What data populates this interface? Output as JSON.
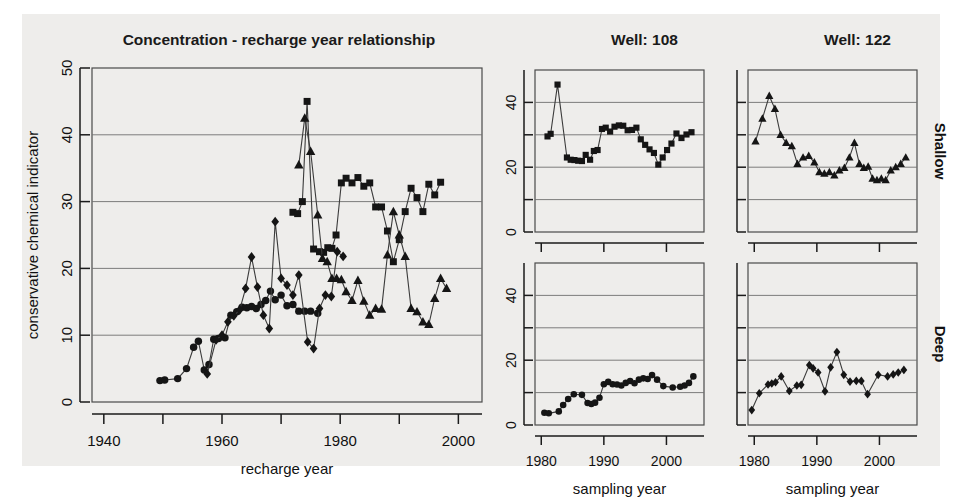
{
  "figure": {
    "background_color": "#eeedeb",
    "marker_color": "#151515",
    "page_color": "#ffffff"
  },
  "main_panel": {
    "title": "Concentration - recharge year relationship",
    "xlabel": "recharge year",
    "ylabel": "conservative chemical indicator",
    "x_ticks": [
      "1940",
      "1960",
      "1980",
      "2000"
    ],
    "y_ticks": [
      "0",
      "10",
      "20",
      "30",
      "40",
      "50"
    ]
  },
  "small_panels": {
    "column_titles": [
      "Well: 108",
      "Well: 122"
    ],
    "row_labels": [
      "Shallow",
      "Deep"
    ],
    "xlabels": [
      "sampling year",
      "sampling year"
    ],
    "x_ticks": [
      "1980",
      "1990",
      "2000"
    ],
    "y_ticks": [
      "0",
      "20",
      "40"
    ]
  },
  "chart_data": [
    {
      "id": "main",
      "type": "scatter",
      "title": "Concentration - recharge year relationship",
      "xlabel": "recharge year",
      "ylabel": "conservative chemical indicator",
      "xlim": [
        1938,
        2004
      ],
      "ylim": [
        0,
        50
      ],
      "xticks": [
        1940,
        1960,
        1980,
        2000
      ],
      "xminorticks": [
        1950,
        1970,
        1990
      ],
      "yticks": [
        0,
        10,
        20,
        30,
        40,
        50
      ],
      "grid": true,
      "legend": "none",
      "series": [
        {
          "name": "Well 108 Deep (circles)",
          "marker": "circle",
          "x": [
            1949.5,
            1950.3,
            1952.5,
            1954.0,
            1955.2,
            1956.0,
            1957.0,
            1957.8,
            1958.6,
            1959.4,
            1960.5,
            1961.5,
            1962.5,
            1963.4,
            1964.2,
            1965.0,
            1965.8,
            1966.6,
            1967.4,
            1968.2,
            1969.0,
            1970.0,
            1971.0,
            1972.0,
            1973.0,
            1974.0,
            1975.0,
            1976.2
          ],
          "y": [
            3.2,
            3.3,
            3.5,
            5.0,
            8.2,
            9.1,
            4.8,
            5.6,
            9.4,
            9.5,
            9.6,
            13.0,
            13.5,
            14.2,
            14.1,
            14.3,
            14.0,
            14.6,
            15.2,
            16.6,
            15.3,
            16.0,
            14.4,
            14.6,
            13.6,
            13.6,
            13.6,
            13.3
          ]
        },
        {
          "name": "Well 122 Deep (diamonds)",
          "marker": "diamond",
          "x": [
            1957.5,
            1959.0,
            1960.0,
            1961.0,
            1962.0,
            1963.0,
            1964.0,
            1965.0,
            1966.0,
            1967.0,
            1968.0,
            1969.0,
            1970.0,
            1971.0,
            1972.0,
            1973.0,
            1974.5,
            1975.5,
            1976.5,
            1977.5,
            1978.5,
            1979.5,
            1980.5
          ],
          "y": [
            4.2,
            9.3,
            10.0,
            12.0,
            12.9,
            13.8,
            17.0,
            21.7,
            17.2,
            13.0,
            11.0,
            27.0,
            18.5,
            17.5,
            16.0,
            19.0,
            9.0,
            8.0,
            14.0,
            16.0,
            15.8,
            22.5,
            21.8
          ]
        },
        {
          "name": "Well 108 Shallow (squares)",
          "marker": "square",
          "x": [
            1972.0,
            1972.8,
            1973.6,
            1974.4,
            1975.5,
            1976.5,
            1977.2,
            1977.9,
            1978.6,
            1979.3,
            1980.2,
            1981.0,
            1982.0,
            1983.0,
            1984.0,
            1985.0,
            1986.0,
            1987.0,
            1988.0,
            1989.0,
            1990.0,
            1991.0,
            1992.0,
            1993.0,
            1994.0,
            1995.0,
            1996.0,
            1997.0
          ],
          "y": [
            28.4,
            28.2,
            30.0,
            45.0,
            22.9,
            22.5,
            22.4,
            23.1,
            23.0,
            25.0,
            32.8,
            33.5,
            32.8,
            33.6,
            32.3,
            32.8,
            29.2,
            29.2,
            25.6,
            21.0,
            24.3,
            28.5,
            32.0,
            30.6,
            28.5,
            32.6,
            31.0,
            32.9
          ]
        },
        {
          "name": "Well 122 Shallow (triangles)",
          "marker": "triangle",
          "x": [
            1973.0,
            1974.0,
            1975.0,
            1976.2,
            1977.0,
            1977.8,
            1978.6,
            1979.4,
            1980.2,
            1981.0,
            1982.0,
            1983.0,
            1984.0,
            1985.0,
            1986.0,
            1987.0,
            1988.0,
            1989.0,
            1990.0,
            1991.0,
            1992.0,
            1993.0,
            1994.0,
            1995.0,
            1996.0,
            1997.0,
            1998.0
          ],
          "y": [
            35.5,
            42.5,
            37.5,
            28.0,
            21.5,
            21.0,
            18.5,
            18.5,
            18.3,
            16.5,
            15.2,
            18.2,
            15.1,
            13.0,
            14.0,
            13.9,
            22.0,
            28.5,
            25.0,
            21.8,
            14.0,
            13.5,
            12.0,
            11.6,
            15.5,
            18.5,
            17.0
          ]
        }
      ]
    },
    {
      "id": "well108-shallow",
      "type": "line",
      "title": "Well: 108",
      "row_label": "Shallow",
      "xlabel": "sampling year",
      "marker": "square",
      "xlim": [
        1979,
        2006
      ],
      "ylim": [
        0,
        50
      ],
      "xticks": [
        1980,
        1990,
        2000
      ],
      "yticks": [
        0,
        20,
        40
      ],
      "yminorticks": [
        10,
        30
      ],
      "grid": true,
      "x": [
        1981.0,
        1981.5,
        1982.6,
        1984.1,
        1984.7,
        1985.3,
        1985.9,
        1986.5,
        1987.1,
        1987.8,
        1988.4,
        1989.0,
        1989.7,
        1990.3,
        1991.0,
        1991.7,
        1992.4,
        1993.1,
        1993.8,
        1994.5,
        1995.2,
        1995.9,
        1996.6,
        1997.3,
        1998.0,
        1998.7,
        1999.4,
        2000.1,
        2000.8,
        2001.6,
        2002.4,
        2003.2,
        2004.0
      ],
      "y": [
        29.5,
        30.3,
        45.5,
        23.0,
        22.3,
        22.2,
        22.0,
        21.9,
        23.8,
        22.3,
        25.0,
        25.3,
        31.8,
        32.2,
        31.0,
        32.5,
        32.9,
        32.8,
        31.4,
        31.5,
        32.2,
        28.6,
        26.9,
        25.5,
        24.4,
        20.8,
        23.0,
        25.3,
        27.3,
        30.4,
        29.0,
        30.1,
        30.8
      ]
    },
    {
      "id": "well122-shallow",
      "type": "line",
      "title": "Well: 122",
      "row_label": "Shallow",
      "xlabel": "sampling year",
      "marker": "triangle",
      "xlim": [
        1979,
        2006
      ],
      "ylim": [
        0,
        50
      ],
      "xticks": [
        1980,
        1990,
        2000
      ],
      "yticks": [
        0,
        20,
        40
      ],
      "yminorticks": [
        10,
        30
      ],
      "grid": true,
      "x": [
        1980.2,
        1981.3,
        1982.4,
        1983.3,
        1984.2,
        1985.1,
        1986.0,
        1986.9,
        1987.8,
        1988.7,
        1989.6,
        1990.4,
        1991.2,
        1992.0,
        1992.8,
        1993.6,
        1994.4,
        1995.2,
        1996.0,
        1996.8,
        1997.5,
        1998.2,
        1998.9,
        1999.6,
        2000.3,
        2001.0,
        2001.8,
        2002.6,
        2003.4,
        2004.2
      ],
      "y": [
        28.0,
        35.0,
        42.0,
        38.0,
        30.0,
        27.5,
        26.5,
        21.0,
        23.0,
        23.5,
        21.5,
        18.5,
        18.0,
        18.5,
        17.5,
        19.0,
        19.8,
        23.0,
        27.5,
        21.0,
        19.8,
        20.2,
        16.5,
        16.0,
        16.5,
        16.0,
        19.0,
        20.0,
        21.0,
        23.0
      ]
    },
    {
      "id": "well108-deep",
      "type": "line",
      "title": "Well: 108",
      "row_label": "Deep",
      "xlabel": "sampling year",
      "marker": "circle",
      "xlim": [
        1979,
        2006
      ],
      "ylim": [
        0,
        50
      ],
      "xticks": [
        1980,
        1990,
        2000
      ],
      "yticks": [
        0,
        20,
        40
      ],
      "yminorticks": [
        10,
        30
      ],
      "grid": true,
      "x": [
        1980.5,
        1981.2,
        1982.8,
        1983.5,
        1984.3,
        1985.2,
        1986.5,
        1987.4,
        1988.0,
        1988.6,
        1989.3,
        1990.0,
        1990.7,
        1991.4,
        1992.1,
        1992.8,
        1993.5,
        1994.2,
        1994.9,
        1995.6,
        1996.3,
        1997.0,
        1997.7,
        1998.5,
        1999.5,
        2001.0,
        2002.2,
        2002.9,
        2003.6,
        2004.3
      ],
      "y": [
        3.8,
        3.6,
        4.2,
        6.2,
        8.0,
        9.5,
        9.3,
        6.8,
        6.5,
        6.9,
        8.4,
        12.6,
        13.3,
        12.6,
        12.5,
        12.2,
        13.0,
        13.6,
        12.9,
        14.0,
        14.4,
        14.2,
        15.4,
        14.0,
        12.0,
        11.6,
        11.8,
        12.2,
        13.0,
        15.0
      ]
    },
    {
      "id": "well122-deep",
      "type": "line",
      "title": "Well: 122",
      "row_label": "Deep",
      "xlabel": "sampling year",
      "marker": "diamond",
      "xlim": [
        1979,
        2006
      ],
      "ylim": [
        0,
        50
      ],
      "xticks": [
        1980,
        1990,
        2000
      ],
      "yticks": [
        0,
        20,
        40
      ],
      "yminorticks": [
        10,
        30
      ],
      "grid": true,
      "x": [
        1979.6,
        1980.8,
        1982.2,
        1982.8,
        1983.4,
        1984.3,
        1985.6,
        1986.8,
        1987.5,
        1988.8,
        1989.4,
        1990.2,
        1991.3,
        1992.2,
        1993.2,
        1994.3,
        1995.3,
        1996.3,
        1997.1,
        1998.1,
        1999.8,
        2001.3,
        2002.2,
        2003.0,
        2003.9
      ],
      "y": [
        4.6,
        9.8,
        12.5,
        12.8,
        13.2,
        15.0,
        10.5,
        12.2,
        12.4,
        18.5,
        17.5,
        16.2,
        10.4,
        17.8,
        22.5,
        15.5,
        13.4,
        13.6,
        13.6,
        9.5,
        15.5,
        15.0,
        15.6,
        16.2,
        17.0
      ]
    }
  ]
}
